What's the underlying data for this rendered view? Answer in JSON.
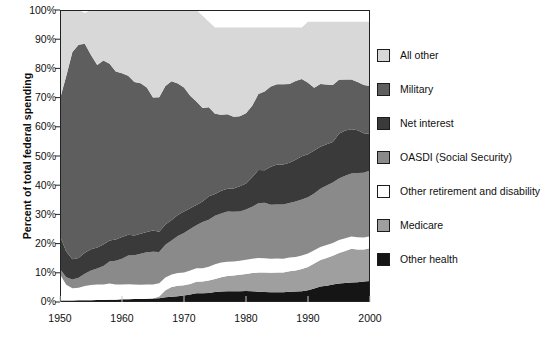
{
  "chart_data": {
    "type": "area",
    "title": "",
    "subtitle": "",
    "xlabel": "",
    "ylabel": "Percent of total federal spending",
    "stacked": true,
    "stack_order_bottom_to_top": [
      "Other health",
      "Medicare",
      "Other retirement and disability",
      "OASDI (Social Security)",
      "Net interest",
      "Military",
      "All other"
    ],
    "grid": false,
    "legend_position": "right",
    "xlim": [
      1950,
      2000
    ],
    "ylim": [
      0,
      100
    ],
    "xticks": [
      1950,
      1960,
      1970,
      1980,
      1990,
      2000
    ],
    "xtick_labels": [
      "1950",
      "1960",
      "1970",
      "1980",
      "1990",
      "2000"
    ],
    "yticks": [
      0,
      10,
      20,
      30,
      40,
      50,
      60,
      70,
      80,
      90,
      100
    ],
    "ytick_labels": [
      "0%",
      "10%",
      "20%",
      "30%",
      "40%",
      "50%",
      "60%",
      "70%",
      "80%",
      "90%",
      "100%"
    ],
    "x": [
      1950,
      1951,
      1952,
      1953,
      1954,
      1955,
      1956,
      1957,
      1958,
      1959,
      1960,
      1961,
      1962,
      1963,
      1964,
      1965,
      1966,
      1967,
      1968,
      1969,
      1970,
      1971,
      1972,
      1973,
      1974,
      1975,
      1976,
      1977,
      1978,
      1979,
      1980,
      1981,
      1982,
      1983,
      1984,
      1985,
      1986,
      1987,
      1988,
      1989,
      1990,
      1991,
      1992,
      1993,
      1994,
      1995,
      1996,
      1997,
      1998,
      1999,
      2000
    ],
    "series": [
      {
        "name": "Other health",
        "color": "#151515",
        "values": [
          0.5,
          0.5,
          0.5,
          0.6,
          0.6,
          0.6,
          0.7,
          0.7,
          0.8,
          0.8,
          0.9,
          0.9,
          1.0,
          1.0,
          1.1,
          1.2,
          1.3,
          1.6,
          1.8,
          2.0,
          2.2,
          2.6,
          3.0,
          3.0,
          3.1,
          3.4,
          3.6,
          3.7,
          3.7,
          3.7,
          3.8,
          3.7,
          3.5,
          3.4,
          3.3,
          3.3,
          3.3,
          3.5,
          3.6,
          3.7,
          4.0,
          4.6,
          5.3,
          5.6,
          6.0,
          6.3,
          6.5,
          6.7,
          6.8,
          7.0,
          7.2
        ]
      },
      {
        "name": "Medicare",
        "color": "#9f9f9f",
        "values": [
          0.0,
          0.0,
          0.0,
          0.0,
          0.0,
          0.0,
          0.0,
          0.0,
          0.0,
          0.0,
          0.0,
          0.0,
          0.0,
          0.0,
          0.0,
          0.0,
          0.6,
          2.4,
          3.3,
          3.6,
          3.5,
          3.6,
          3.9,
          4.0,
          4.3,
          4.5,
          4.9,
          5.2,
          5.4,
          5.6,
          5.8,
          6.2,
          6.6,
          6.7,
          6.7,
          6.8,
          6.8,
          7.0,
          7.2,
          7.6,
          8.0,
          8.6,
          9.1,
          9.5,
          9.8,
          10.5,
          11.0,
          11.5,
          11.2,
          11.0,
          11.2
        ]
      },
      {
        "name": "Other retirement and disability",
        "color": "#ffffff",
        "values": [
          9.0,
          5.4,
          4.2,
          4.3,
          4.9,
          5.2,
          5.3,
          5.3,
          5.5,
          5.2,
          5.1,
          5.2,
          5.0,
          4.9,
          4.9,
          4.8,
          4.5,
          4.4,
          4.3,
          4.3,
          4.4,
          4.6,
          4.7,
          4.6,
          4.7,
          5.0,
          5.0,
          4.9,
          4.8,
          4.8,
          4.9,
          4.9,
          5.0,
          4.9,
          4.8,
          4.8,
          4.7,
          4.7,
          4.6,
          4.6,
          4.6,
          4.5,
          4.4,
          4.4,
          4.4,
          4.4,
          4.3,
          4.2,
          4.2,
          4.1,
          4.1
        ]
      },
      {
        "name": "OASDI (Social Security)",
        "color": "#8a8a8a",
        "values": [
          1.8,
          2.6,
          3.0,
          3.4,
          4.2,
          5.0,
          5.5,
          6.3,
          7.6,
          8.1,
          8.8,
          9.8,
          10.0,
          10.6,
          11.0,
          11.2,
          10.7,
          11.2,
          11.7,
          12.7,
          13.5,
          14.2,
          14.7,
          15.8,
          16.1,
          16.6,
          16.8,
          17.2,
          17.0,
          16.9,
          17.2,
          17.8,
          18.7,
          19.0,
          18.5,
          18.5,
          18.6,
          18.7,
          19.0,
          19.2,
          19.3,
          19.5,
          20.0,
          20.4,
          20.7,
          21.1,
          21.4,
          21.6,
          22.0,
          22.2,
          22.5
        ]
      },
      {
        "name": "Net interest",
        "color": "#3a3a3a",
        "values": [
          11.3,
          8.8,
          6.9,
          6.8,
          7.2,
          7.3,
          7.2,
          7.4,
          7.2,
          7.3,
          7.5,
          7.1,
          6.8,
          6.9,
          7.0,
          7.3,
          7.0,
          6.9,
          7.0,
          7.2,
          7.4,
          7.1,
          6.9,
          7.0,
          8.0,
          7.5,
          7.8,
          7.8,
          8.0,
          8.6,
          8.9,
          10.1,
          11.4,
          11.1,
          13.0,
          13.7,
          13.7,
          13.8,
          14.3,
          14.8,
          14.7,
          14.7,
          14.4,
          14.1,
          13.9,
          15.3,
          15.5,
          15.2,
          14.6,
          13.5,
          12.5
        ]
      },
      {
        "name": "Military",
        "color": "#5e5e5e",
        "values": [
          47.0,
          60.0,
          71.0,
          73.0,
          71.5,
          66.5,
          62.5,
          63.0,
          60.5,
          57.5,
          56.0,
          54.5,
          52.5,
          51.5,
          49.5,
          45.5,
          46.0,
          47.5,
          47.5,
          45.0,
          42.5,
          38.5,
          35.5,
          32.0,
          30.5,
          27.5,
          26.0,
          25.5,
          24.5,
          24.0,
          24.0,
          24.5,
          26.0,
          27.0,
          27.5,
          27.5,
          27.5,
          27.0,
          27.0,
          26.5,
          24.5,
          21.5,
          21.5,
          20.5,
          19.5,
          18.5,
          17.5,
          17.0,
          16.5,
          16.5,
          16.5
        ]
      },
      {
        "name": "All other",
        "color": "#d8d8d8",
        "values": [
          30.4,
          22.7,
          14.4,
          11.9,
          10.6,
          15.4,
          18.8,
          17.3,
          18.4,
          21.1,
          21.7,
          22.5,
          24.7,
          25.1,
          26.5,
          30.0,
          29.9,
          26.0,
          24.4,
          25.2,
          26.5,
          29.4,
          31.3,
          31.6,
          29.3,
          29.5,
          29.9,
          29.7,
          30.6,
          30.4,
          29.4,
          26.8,
          22.8,
          21.9,
          20.2,
          19.4,
          19.4,
          19.3,
          18.3,
          17.6,
          20.9,
          22.6,
          21.3,
          21.5,
          21.7,
          19.9,
          19.8,
          19.8,
          20.7,
          21.7,
          22.0
        ]
      }
    ]
  },
  "legend": {
    "items": [
      {
        "label": "All other",
        "color": "#d8d8d8"
      },
      {
        "label": "Military",
        "color": "#5e5e5e"
      },
      {
        "label": "Net interest",
        "color": "#3a3a3a"
      },
      {
        "label": "OASDI (Social Security)",
        "color": "#8a8a8a"
      },
      {
        "label": "Other retirement and disability",
        "color": "#ffffff"
      },
      {
        "label": "Medicare",
        "color": "#9f9f9f"
      },
      {
        "label": "Other health",
        "color": "#151515"
      }
    ]
  },
  "axes": {
    "ylabel": "Percent of total federal spending",
    "ytick_labels": [
      "100%",
      "90%",
      "80%",
      "70%",
      "60%",
      "50%",
      "40%",
      "30%",
      "20%",
      "10%",
      "0%"
    ],
    "xtick_labels": [
      "1950",
      "1960",
      "1970",
      "1980",
      "1990",
      "2000"
    ]
  }
}
